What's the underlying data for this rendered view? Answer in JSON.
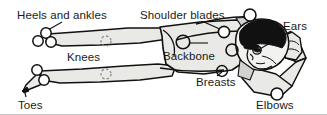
{
  "figure": {
    "type": "anatomical-line-illustration",
    "width": 327,
    "height": 115,
    "background_color": "#ffffff",
    "body_fill_color": "#e9e9e6",
    "body_shadow_color": "#bdbdba",
    "outline_color": "#111111",
    "hair_fill_color": "#111111",
    "marker_outline_color": "#111111",
    "marker_fill_color": "#ffffff",
    "dashed_marker_color": "#8d8d8a",
    "text_color": "#1a1a1a",
    "bottom_rule_color": "#c8c8c8"
  },
  "labels": {
    "heels_and_ankles": "Heels and ankles",
    "shoulder_blades": "Shoulder blades",
    "ears": "Ears",
    "knees": "Knees",
    "backbone": "Backbone",
    "breasts": "Breasts",
    "toes": "Toes",
    "elbows": "Elbows"
  },
  "markers": [
    {
      "name": "heel-marker-upper",
      "label": "Heels and ankles",
      "style": "solid",
      "cx": 46,
      "cy": 33,
      "r": 5.2
    },
    {
      "name": "ankle-marker-left",
      "label": "Heels and ankles",
      "style": "solid",
      "cx": 38,
      "cy": 41,
      "r": 5.2
    },
    {
      "name": "ankle-marker-right",
      "label": "Heels and ankles",
      "style": "solid",
      "cx": 51,
      "cy": 42,
      "r": 5.2
    },
    {
      "name": "knee-marker-upper",
      "label": "Knees",
      "style": "dashed",
      "cx": 106,
      "cy": 41,
      "r": 5.0
    },
    {
      "name": "knee-marker-lower",
      "label": "Knees",
      "style": "dashed",
      "cx": 106,
      "cy": 74,
      "r": 5.0
    },
    {
      "name": "toe-marker-upper",
      "label": "Toes",
      "style": "solid",
      "cx": 37,
      "cy": 70,
      "r": 5.2
    },
    {
      "name": "toe-marker-lower",
      "label": "Toes",
      "style": "solid",
      "cx": 44,
      "cy": 80,
      "r": 5.2
    },
    {
      "name": "toe-marker-tip",
      "label": "Toes",
      "style": "filled",
      "cx": 23,
      "cy": 90,
      "r": 4.6
    },
    {
      "name": "shoulder-blade-marker-top",
      "label": "Shoulder blades",
      "style": "solid",
      "cx": 250,
      "cy": 15,
      "r": 6.0
    },
    {
      "name": "shoulder-blade-marker-side",
      "label": "Shoulder blades",
      "style": "solid",
      "cx": 225,
      "cy": 32,
      "r": 5.6
    },
    {
      "name": "backbone-marker",
      "label": "Backbone",
      "style": "solid",
      "cx": 183,
      "cy": 42,
      "r": 6.8
    },
    {
      "name": "backbone-marker-secondary",
      "label": "Backbone",
      "style": "solid",
      "cx": 232,
      "cy": 50,
      "r": 6.0
    },
    {
      "name": "breast-marker",
      "label": "Breasts",
      "style": "solid",
      "cx": 222,
      "cy": 71,
      "r": 5.4
    },
    {
      "name": "ear-marker",
      "label": "Ears",
      "style": "solid",
      "cx": 256,
      "cy": 50,
      "r": 4.2
    },
    {
      "name": "elbow-marker",
      "label": "Elbows",
      "style": "solid",
      "cx": 277,
      "cy": 95,
      "r": 6.0
    }
  ],
  "leader_lines": [
    {
      "name": "leader-heels-and-ankles",
      "from": [
        60,
        22
      ],
      "to": [
        47,
        30
      ]
    },
    {
      "name": "leader-shoulder-blades",
      "from": [
        205,
        22
      ],
      "to": [
        223,
        30
      ]
    },
    {
      "name": "leader-ears",
      "from": [
        292,
        31
      ],
      "to": [
        257,
        50
      ]
    },
    {
      "name": "leader-backbone",
      "from": [
        190,
        44
      ],
      "to": [
        205,
        44
      ]
    },
    {
      "name": "leader-breasts",
      "from": [
        216,
        75
      ],
      "to": [
        222,
        72
      ]
    },
    {
      "name": "leader-elbows",
      "from": [
        278,
        100
      ],
      "to": [
        278,
        96
      ]
    }
  ]
}
